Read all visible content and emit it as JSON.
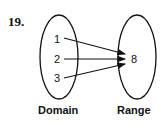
{
  "problem_number": "19.",
  "domain": {
    "label": "Domain",
    "values": [
      "1",
      "2",
      "3"
    ]
  },
  "range": {
    "label": "Range",
    "values": [
      "8"
    ]
  },
  "mapping": [
    {
      "from": "1",
      "to": "8"
    },
    {
      "from": "2",
      "to": "8"
    },
    {
      "from": "3",
      "to": "8"
    }
  ],
  "colors": {
    "ink": "#111111",
    "background": "#ffffff"
  }
}
